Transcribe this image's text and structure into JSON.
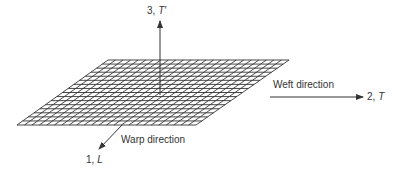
{
  "diagram": {
    "type": "fabric-coordinate-system",
    "grid": {
      "columns": 24,
      "rows": 16,
      "stroke": "#333333",
      "corners": {
        "top_left": [
          108,
          60
        ],
        "top_right": [
          289,
          60
        ],
        "bottom_right": [
          196,
          125
        ],
        "bottom_left": [
          17,
          125
        ]
      }
    },
    "axes": {
      "vertical": {
        "number": "3,",
        "symbol": "T′"
      },
      "weft": {
        "label": "Weft direction",
        "number": "2,",
        "symbol": "T"
      },
      "warp": {
        "label": "Warp direction",
        "number": "1,",
        "symbol": "L"
      }
    }
  }
}
